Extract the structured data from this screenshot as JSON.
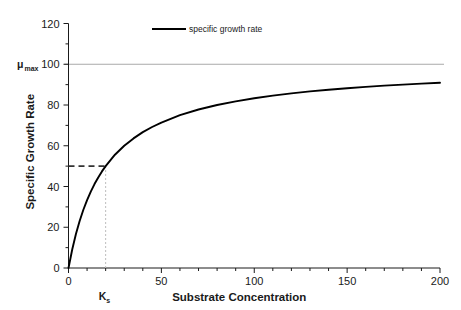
{
  "chart_data": {
    "type": "line",
    "title": "",
    "xlabel": "Substrate Concentration",
    "ylabel": "Specific Growth Rate",
    "xlim": [
      0,
      200
    ],
    "ylim": [
      0,
      120
    ],
    "xticks": [
      0,
      10,
      20,
      30,
      40,
      50,
      60,
      70,
      80,
      90,
      100,
      110,
      120,
      130,
      140,
      150,
      160,
      170,
      180,
      190,
      200
    ],
    "xtick_labels": [
      {
        "value": 0,
        "label": "0"
      },
      {
        "value": 50,
        "label": "50"
      },
      {
        "value": 100,
        "label": "100"
      },
      {
        "value": 150,
        "label": "150"
      },
      {
        "value": 200,
        "label": "200"
      }
    ],
    "yticks": [
      0,
      10,
      20,
      30,
      40,
      50,
      60,
      70,
      80,
      90,
      100,
      110,
      120
    ],
    "ytick_labels": [
      {
        "value": 0,
        "label": "0"
      },
      {
        "value": 20,
        "label": "20"
      },
      {
        "value": 40,
        "label": "40"
      },
      {
        "value": 60,
        "label": "60"
      },
      {
        "value": 80,
        "label": "80"
      },
      {
        "value": 100,
        "label": "100"
      },
      {
        "value": 120,
        "label": "120"
      }
    ],
    "grid": false,
    "legend": {
      "position": "top-center",
      "entries": [
        {
          "label": "specific growth rate",
          "color": "#000000",
          "marker": "line"
        }
      ]
    },
    "model": {
      "equation": "mu = mu_max * S / (Ks + S)",
      "mu_max": 100,
      "Ks": 20
    },
    "series": [
      {
        "name": "specific growth rate",
        "color": "#000000",
        "x": [
          0,
          2,
          4,
          6,
          8,
          10,
          12,
          14,
          16,
          18,
          20,
          25,
          30,
          35,
          40,
          45,
          50,
          60,
          70,
          80,
          90,
          100,
          110,
          120,
          130,
          140,
          150,
          160,
          170,
          180,
          190,
          200
        ],
        "y": [
          0,
          9.1,
          16.7,
          23.1,
          28.6,
          33.3,
          37.5,
          41.2,
          44.4,
          47.4,
          50.0,
          55.6,
          60.0,
          63.6,
          66.7,
          69.2,
          71.4,
          75.0,
          77.8,
          80.0,
          81.8,
          83.3,
          84.6,
          85.7,
          86.7,
          87.5,
          88.2,
          88.9,
          89.5,
          90.0,
          90.5,
          90.9
        ]
      }
    ],
    "annotations": [
      {
        "name": "mu-max-line",
        "kind": "hline",
        "y": 100,
        "color": "#a9a9a9",
        "style": "solid",
        "label": "μ",
        "label_sub": "max"
      },
      {
        "name": "half-saturation-hline",
        "kind": "hline-segment",
        "y": 50,
        "x_from": 0,
        "x_to": 20,
        "color": "#333333",
        "style": "dashed"
      },
      {
        "name": "ks-vline",
        "kind": "vline-segment",
        "x": 20,
        "y_from": 0,
        "y_to": 50,
        "color": "#bdbdbd",
        "style": "dashed",
        "label": "K",
        "label_sub": "s"
      }
    ]
  },
  "colors": {
    "axis": "#1a1a1a",
    "curve": "#000000",
    "mu_max_line": "#a9a9a9",
    "dash_dark": "#333333",
    "dash_light": "#bdbdbd",
    "background": "#ffffff"
  }
}
